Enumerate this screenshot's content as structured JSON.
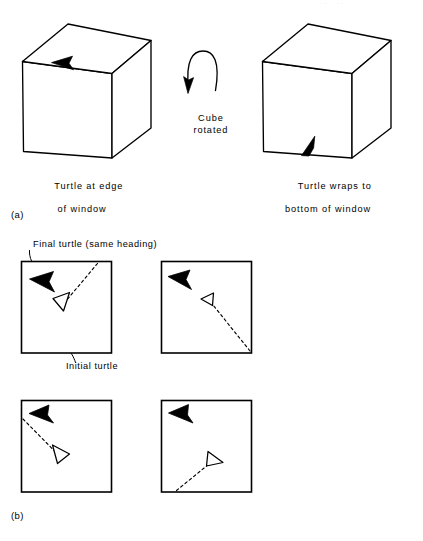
{
  "figure": {
    "page_bleed_text": "··  ··",
    "parts": [
      {
        "key": "a",
        "label": "(a)"
      },
      {
        "key": "b",
        "label": "(b)"
      }
    ]
  },
  "part_a": {
    "label": "(a)",
    "left_cube": {
      "name": "cube-before-rotation",
      "caption_line1": "Turtle at edge",
      "caption_line2": "of window",
      "turtle": {
        "name": "turtle-marker-top-edge",
        "fill": "#000000",
        "heading": "left",
        "position": "top-front-edge"
      }
    },
    "rotation": {
      "name": "cube-rotation-arrow",
      "label_line1": "Cube",
      "label_line2": "rotated",
      "direction": "counterclockwise"
    },
    "right_cube": {
      "name": "cube-after-rotation",
      "caption_line1": "Turtle wraps to",
      "caption_line2": "bottom of window",
      "turtle": {
        "name": "turtle-marker-bottom-edge",
        "fill": "#000000",
        "heading": "up-right",
        "position": "bottom-front-edge"
      }
    }
  },
  "part_b": {
    "label": "(b)",
    "annotations": [
      {
        "name": "final-turtle-annotation",
        "text": "Final turtle (same heading)",
        "target": "panel-1-final-turtle"
      },
      {
        "name": "initial-turtle-annotation",
        "text": "Initial turtle",
        "target": "panel-1-initial-turtle"
      }
    ],
    "panels": [
      {
        "name": "window-panel-1",
        "index": 1,
        "final_turtle": {
          "fill": "#000000",
          "heading": "left"
        },
        "initial_turtle": {
          "fill": "#ffffff",
          "heading": "right"
        },
        "path_exit_edge": "top-right"
      },
      {
        "name": "window-panel-2",
        "index": 2,
        "final_turtle": {
          "fill": "#000000",
          "heading": "left"
        },
        "initial_turtle": {
          "fill": "#ffffff",
          "heading": "right"
        },
        "path_exit_edge": "bottom-right-corner"
      },
      {
        "name": "window-panel-3",
        "index": 3,
        "final_turtle": {
          "fill": "#000000",
          "heading": "up-left"
        },
        "initial_turtle": {
          "fill": "#ffffff",
          "heading": "down-right"
        },
        "path_exit_edge": "left"
      },
      {
        "name": "window-panel-4",
        "index": 4,
        "final_turtle": {
          "fill": "#000000",
          "heading": "up-left"
        },
        "initial_turtle": {
          "fill": "#ffffff",
          "heading": "right"
        },
        "path_exit_edge": "bottom"
      }
    ]
  },
  "style": {
    "ink": "#000000",
    "paper": "#ffffff",
    "stroke_width": 1.3
  }
}
